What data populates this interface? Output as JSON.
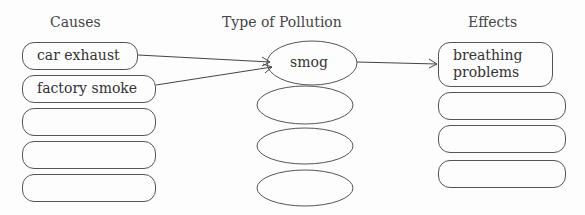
{
  "headers": {
    "causes": "Causes",
    "type": "Type of Pollution",
    "effects": "Effects"
  },
  "causes": [
    "car exhaust",
    "factory smoke",
    "",
    "",
    ""
  ],
  "types": [
    "smog",
    "",
    "",
    ""
  ],
  "effects": [
    "breathing problems",
    "",
    "",
    ""
  ],
  "effect_lines": [
    "breathing",
    "problems"
  ],
  "arrows": [
    {
      "from": "car exhaust",
      "to": "smog"
    },
    {
      "from": "factory smoke",
      "to": "smog"
    },
    {
      "from": "smog",
      "to": "breathing problems"
    }
  ],
  "colors": {
    "stroke": "#555555",
    "text": "#333333",
    "background": "#fdfdfd"
  }
}
